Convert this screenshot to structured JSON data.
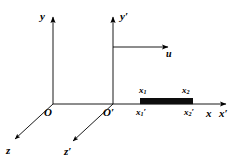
{
  "figure": {
    "background_color": "#ffffff",
    "stroke_color": "#000000",
    "bar_color": "#0d0d0d",
    "width": 238,
    "height": 163
  },
  "labels": {
    "y_axis": "y",
    "y_prime_axis": "y′",
    "x_axis": "x",
    "x_prime_axis": "x′",
    "z_axis": "z",
    "z_prime_axis": "z′",
    "origin": "O",
    "origin_prime": "O′",
    "velocity": "u",
    "x1": "x",
    "x1_sub": "1",
    "x2": "x",
    "x2_sub": "2",
    "x1_prime": "x",
    "x1_prime_sub": "1",
    "x1_prime_mark": "′",
    "x2_prime": "x",
    "x2_prime_sub": "2",
    "x2_prime_mark": "′"
  },
  "geometry": {
    "frame_unprimed": {
      "origin": [
        53,
        104
      ],
      "y_top": [
        53,
        14
      ],
      "x_right": [
        232,
        104
      ],
      "z_end": [
        13,
        141
      ]
    },
    "frame_primed": {
      "origin": [
        113,
        104
      ],
      "y_top": [
        113,
        14
      ],
      "x_right": [
        232,
        104
      ],
      "z_end": [
        71,
        143
      ]
    },
    "velocity_arrow": {
      "from": [
        113,
        47
      ],
      "to": [
        174,
        47
      ]
    },
    "rod": {
      "x_start": 140,
      "x_end": 193,
      "y_top": 98,
      "y_bottom": 104
    }
  }
}
